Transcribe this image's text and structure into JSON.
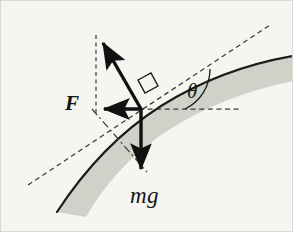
{
  "figure": {
    "background_color": "#f6f5f1",
    "border_color": "#d9d8d2",
    "width": 293,
    "height": 232
  },
  "labels": {
    "force_F": "F",
    "weight_mg": "mg",
    "angle_theta": "θ"
  },
  "colors": {
    "surface_fill": "#ced2c9",
    "surface_edge": "#1b1b1b",
    "vector_stroke": "#111111",
    "dashed_stroke": "#3a3a3a",
    "background": "#f6f5f1"
  },
  "geometry": {
    "origin": {
      "x": 140,
      "y": 108
    },
    "normal_arrow_tip": {
      "x": 97,
      "y": 36
    },
    "applied_force_arrow_tip": {
      "x": 95,
      "y": 108
    },
    "weight_arrow_tip": {
      "x": 140,
      "y": 176
    },
    "tangent_line": {
      "x1": 27,
      "y1": 184,
      "x2": 269,
      "y2": 24
    },
    "horizontal_reference_line": {
      "x1": 140,
      "y1": 108,
      "x2": 241,
      "y2": 108
    },
    "vertical_dashed_line": {
      "x1": 95,
      "y1": 35,
      "x2": 95,
      "y2": 112
    },
    "normal_dashdot_line": {
      "x1": 92,
      "y1": 109,
      "x2": 145,
      "y2": 170
    },
    "right_angle_marker": {
      "x": 144,
      "y": 86,
      "size": 15
    },
    "angle_arc_radius": 44
  },
  "elements": {
    "surface_band_name": "curved-inclined-surface",
    "normal_vector_name": "normal-force-vector",
    "applied_vector_name": "applied-force-vector",
    "weight_vector_name": "weight-force-vector"
  }
}
